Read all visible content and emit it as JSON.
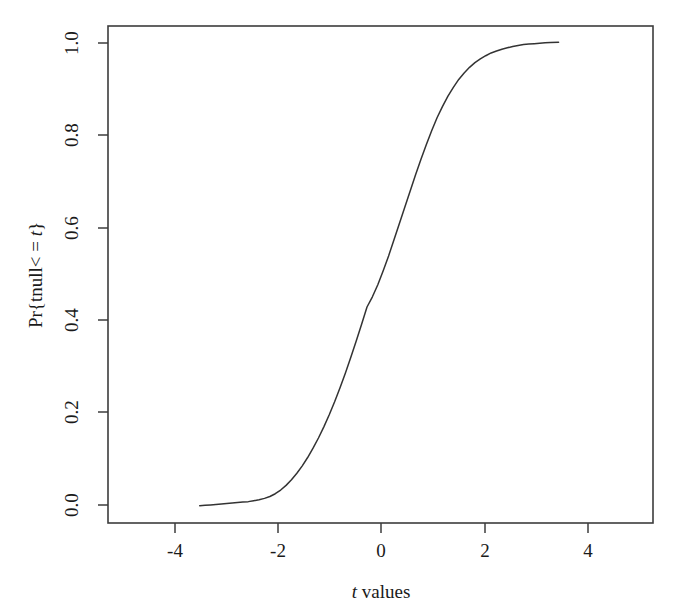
{
  "chart_data": {
    "type": "line",
    "title": "",
    "subtitle": "",
    "xlabel": "t values",
    "xlabel_italic_prefix": "t",
    "xlabel_rest": " values",
    "ylabel": "Pr{tnull< = t}",
    "ylabel_pre": "Pr{tnull< = ",
    "ylabel_italic": "t",
    "ylabel_post": "}",
    "xlim": [
      -5.1,
      5.0
    ],
    "ylim": [
      -0.035,
      1.035
    ],
    "xticks": [
      -4,
      -2,
      0,
      2,
      4
    ],
    "xtick_labels": [
      "-4",
      "-2",
      "0",
      "2",
      "4"
    ],
    "yticks": [
      0.0,
      0.2,
      0.4,
      0.6,
      0.8,
      1.0
    ],
    "ytick_labels": [
      "0.0",
      "0.2",
      "0.4",
      "0.6",
      "0.8",
      "1.0"
    ],
    "grid": false,
    "legend": null,
    "legend_position": "none",
    "series": [
      {
        "name": "empirical CDF of null t values",
        "color": "#333333",
        "x": [
          -3.4,
          -3.3,
          -3.2,
          -3.1,
          -3.0,
          -2.9,
          -2.8,
          -2.7,
          -2.6,
          -2.5,
          -2.4,
          -2.3,
          -2.2,
          -2.1,
          -2.0,
          -1.9,
          -1.8,
          -1.7,
          -1.6,
          -1.5,
          -1.4,
          -1.3,
          -1.2,
          -1.1,
          -1.0,
          -0.9,
          -0.8,
          -0.7,
          -0.6,
          -0.5,
          -0.4,
          -0.3,
          -0.2,
          -0.1,
          0.0,
          0.1,
          0.2,
          0.3,
          0.4,
          0.5,
          0.6,
          0.7,
          0.8,
          0.9,
          1.0,
          1.1,
          1.2,
          1.3,
          1.4,
          1.5,
          1.6,
          1.7,
          1.8,
          1.9,
          2.0,
          2.1,
          2.2,
          2.3,
          2.4,
          2.5,
          2.6,
          2.7,
          2.8,
          2.9,
          3.0,
          3.1,
          3.25
        ],
        "y": [
          0.002,
          0.003,
          0.004,
          0.005,
          0.006,
          0.007,
          0.008,
          0.009,
          0.01,
          0.011,
          0.013,
          0.015,
          0.018,
          0.022,
          0.028,
          0.036,
          0.046,
          0.058,
          0.072,
          0.088,
          0.106,
          0.126,
          0.148,
          0.172,
          0.198,
          0.226,
          0.256,
          0.288,
          0.322,
          0.357,
          0.393,
          0.43,
          0.452,
          0.478,
          0.508,
          0.54,
          0.575,
          0.61,
          0.645,
          0.68,
          0.715,
          0.748,
          0.78,
          0.81,
          0.838,
          0.862,
          0.884,
          0.903,
          0.92,
          0.934,
          0.946,
          0.956,
          0.964,
          0.971,
          0.977,
          0.981,
          0.985,
          0.988,
          0.991,
          0.993,
          0.995,
          0.996,
          0.997,
          0.998,
          0.999,
          0.9995,
          1.0
        ]
      }
    ]
  },
  "plot_geometry": {
    "frame_left": 108,
    "frame_right": 653,
    "frame_top": 26,
    "frame_bottom": 523
  }
}
